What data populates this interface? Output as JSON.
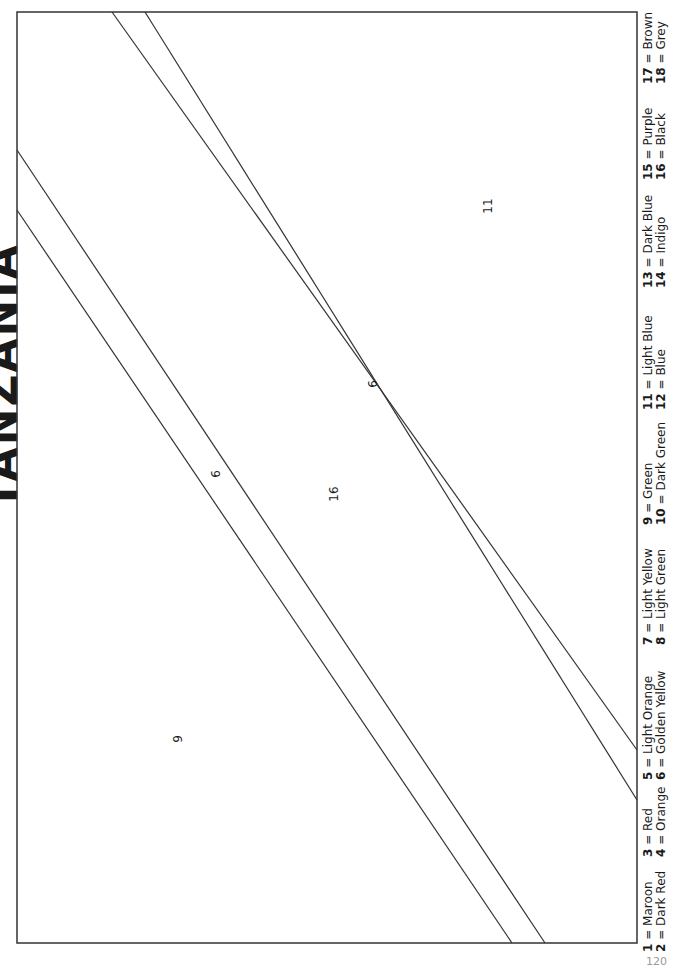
{
  "page": {
    "title": "TANZANIA",
    "page_number": "120"
  },
  "regions": [
    {
      "label": "9",
      "color_name": "Green"
    },
    {
      "label": "6",
      "color_name": "Golden Yellow"
    },
    {
      "label": "16",
      "color_name": "Black"
    },
    {
      "label": "6",
      "color_name": "Golden Yellow"
    },
    {
      "label": "11",
      "color_name": "Light Blue"
    }
  ],
  "legend": [
    {
      "num": "1",
      "name": "Maroon"
    },
    {
      "num": "2",
      "name": "Dark Red"
    },
    {
      "num": "3",
      "name": "Red"
    },
    {
      "num": "4",
      "name": "Orange"
    },
    {
      "num": "5",
      "name": "Light Orange"
    },
    {
      "num": "6",
      "name": "Golden Yellow"
    },
    {
      "num": "7",
      "name": "Light Yellow"
    },
    {
      "num": "8",
      "name": "Light Green"
    },
    {
      "num": "9",
      "name": "Green"
    },
    {
      "num": "10",
      "name": "Dark Green"
    },
    {
      "num": "11",
      "name": "Light Blue"
    },
    {
      "num": "12",
      "name": "Blue"
    },
    {
      "num": "13",
      "name": "Dark Blue"
    },
    {
      "num": "14",
      "name": "Indigo"
    },
    {
      "num": "15",
      "name": "Purple"
    },
    {
      "num": "16",
      "name": "Black"
    },
    {
      "num": "17",
      "name": "Brown"
    },
    {
      "num": "18",
      "name": "Grey"
    }
  ],
  "colors": {
    "line": "#333333",
    "page_number": "#9a9a9a"
  }
}
